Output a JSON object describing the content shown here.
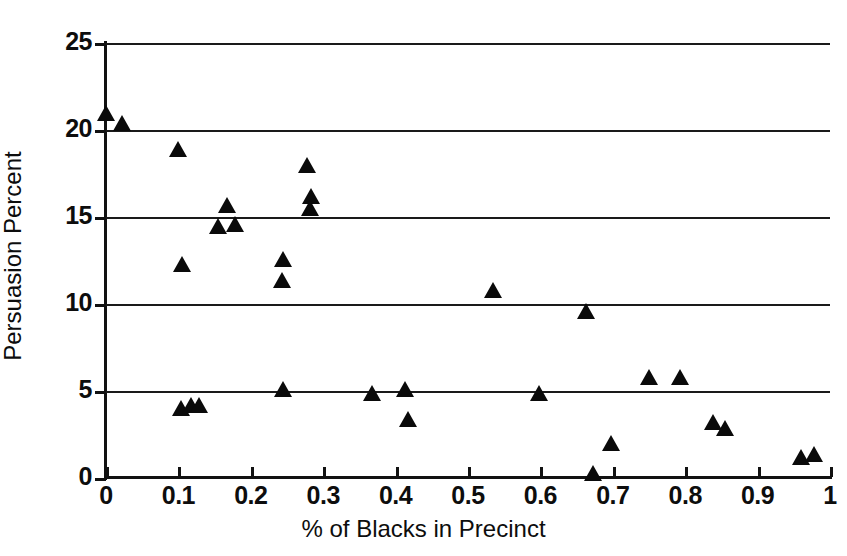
{
  "chart_data": {
    "type": "scatter",
    "title": "",
    "xlabel": "% of Blacks in Precinct",
    "ylabel": "Persuasion Percent",
    "xlim": [
      0,
      1
    ],
    "ylim": [
      0,
      25
    ],
    "xticks": [
      0,
      0.1,
      0.2,
      0.3,
      0.4,
      0.5,
      0.6,
      0.7,
      0.8,
      0.9,
      1
    ],
    "xticklabels": [
      "0",
      "0.1",
      "0.2",
      "0.3",
      "0.4",
      "0.5",
      "0.6",
      "0.7",
      "0.8",
      "0.9",
      "1"
    ],
    "yticks": [
      0,
      5,
      10,
      15,
      20,
      25
    ],
    "yticklabels": [
      "0",
      "5",
      "10",
      "15",
      "20",
      "25"
    ],
    "grid": "horizontal",
    "gridlines_y": [
      0,
      5,
      10,
      15,
      20,
      25
    ],
    "legend": "none",
    "marker": "triangle-up",
    "marker_color": "#0a0a0a",
    "series": [
      {
        "name": "precincts",
        "points": [
          [
            0.0,
            21.0
          ],
          [
            0.022,
            20.4
          ],
          [
            0.1,
            18.9
          ],
          [
            0.105,
            12.3
          ],
          [
            0.103,
            4.0
          ],
          [
            0.117,
            4.2
          ],
          [
            0.128,
            4.2
          ],
          [
            0.155,
            14.5
          ],
          [
            0.167,
            15.7
          ],
          [
            0.178,
            14.6
          ],
          [
            0.245,
            12.6
          ],
          [
            0.243,
            11.4
          ],
          [
            0.244,
            5.1
          ],
          [
            0.278,
            18.0
          ],
          [
            0.283,
            16.2
          ],
          [
            0.282,
            15.5
          ],
          [
            0.368,
            4.9
          ],
          [
            0.413,
            5.1
          ],
          [
            0.417,
            3.4
          ],
          [
            0.535,
            10.8
          ],
          [
            0.598,
            4.9
          ],
          [
            0.663,
            9.6
          ],
          [
            0.672,
            0.3
          ],
          [
            0.697,
            2.0
          ],
          [
            0.75,
            5.8
          ],
          [
            0.793,
            5.8
          ],
          [
            0.838,
            3.2
          ],
          [
            0.855,
            2.9
          ],
          [
            0.96,
            1.2
          ],
          [
            0.978,
            1.4
          ]
        ]
      }
    ]
  }
}
